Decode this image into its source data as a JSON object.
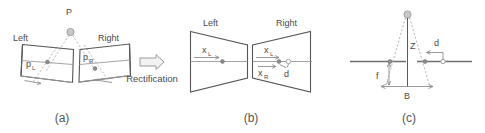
{
  "figure": {
    "background_color": "#ffffff",
    "line_color": "#5a5a5a",
    "dashed_ray_color": "#b0b0b0",
    "text_color": "#4a4a4a",
    "width": 485,
    "height": 133
  },
  "panel_a": {
    "caption": "(a)",
    "scene_point_label": "P",
    "left_plane_label": "Left",
    "right_plane_label": "Right",
    "left_projection_label": "p",
    "left_projection_subscript": "L",
    "right_projection_label": "p",
    "right_projection_subscript": "R",
    "description": "Two non-parallel (converging) image planes with the 3D point P projecting to p_L and p_R; epipolar lines are slanted."
  },
  "transition": {
    "process_label": "Rectification",
    "arrow_icon": "right-arrow-icon",
    "arrow_direction": "right"
  },
  "panel_b": {
    "caption": "(b)",
    "left_plane_label": "Left",
    "right_plane_label": "Right",
    "left_coord_label": "x",
    "left_coord_subscript": "L",
    "right_top_coord_label": "x",
    "right_top_coord_subscript": "L",
    "right_bottom_coord_label": "x",
    "right_bottom_coord_subscript": "R",
    "disparity_label": "d",
    "description": "After rectification the epipolar lines are horizontal and aligned; disparity d is the horizontal offset between x_L and x_R."
  },
  "panel_c": {
    "caption": "(c)",
    "depth_label": "Z",
    "baseline_label": "B",
    "focal_label": "f",
    "disparity_label": "d",
    "description": "Top-down triangulation geometry: depth Z, baseline B between the two camera centers, focal length f, and disparity d."
  },
  "captions": [
    "(a)",
    "(b)",
    "(c)"
  ]
}
